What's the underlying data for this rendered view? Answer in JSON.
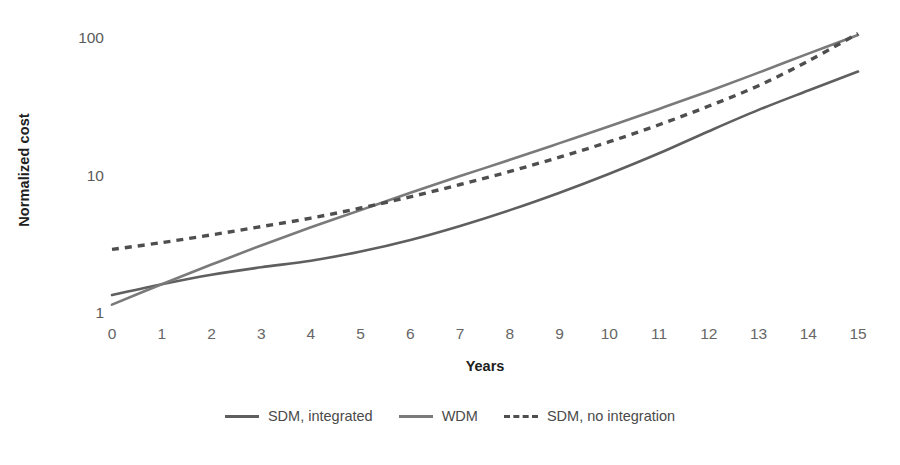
{
  "chart_data": {
    "type": "line",
    "title": "",
    "xlabel": "Years",
    "ylabel": "Normalized cost",
    "yscale": "log",
    "xscale": "linear",
    "xlim": [
      0,
      15
    ],
    "ylim": [
      1,
      100
    ],
    "grid": false,
    "legend_position": "bottom-center",
    "xticks": [
      "0",
      "1",
      "2",
      "3",
      "4",
      "5",
      "6",
      "7",
      "8",
      "9",
      "10",
      "11",
      "12",
      "13",
      "14",
      "15"
    ],
    "yticks": [
      "1",
      "10",
      "100"
    ],
    "x": [
      0,
      1,
      2,
      3,
      4,
      5,
      6,
      7,
      8,
      9,
      10,
      11,
      12,
      13,
      14,
      15
    ],
    "series": [
      {
        "name": "SDM, integrated",
        "style": "solid",
        "color": "#5f5f5f",
        "values": [
          1.35,
          1.62,
          1.9,
          2.15,
          2.4,
          2.8,
          3.4,
          4.3,
          5.6,
          7.5,
          10.3,
          14.5,
          21.0,
          30.0,
          41.5,
          57.0
        ]
      },
      {
        "name": "WDM",
        "style": "solid",
        "color": "#7a7a7a",
        "values": [
          1.15,
          1.62,
          2.25,
          3.1,
          4.2,
          5.6,
          7.5,
          9.9,
          13.0,
          17.2,
          22.8,
          30.5,
          41.0,
          56.0,
          77.0,
          105.0
        ]
      },
      {
        "name": "SDM, no integration",
        "style": "dashed",
        "color": "#4e4e4e",
        "values": [
          2.9,
          3.25,
          3.7,
          4.25,
          4.9,
          5.8,
          7.0,
          8.6,
          10.7,
          13.6,
          17.6,
          23.4,
          32.0,
          45.0,
          68.0,
          108.0
        ]
      }
    ]
  },
  "legend": {
    "items": [
      {
        "label": "SDM, integrated",
        "color": "#5f5f5f",
        "dashed": false
      },
      {
        "label": "WDM",
        "color": "#7a7a7a",
        "dashed": false
      },
      {
        "label": "SDM, no integration",
        "color": "#4e4e4e",
        "dashed": true
      }
    ]
  },
  "colors": {
    "background": "#ffffff",
    "tick_text": "#666666",
    "axis_title": "#202020",
    "legend_text": "#4a4a4a"
  }
}
